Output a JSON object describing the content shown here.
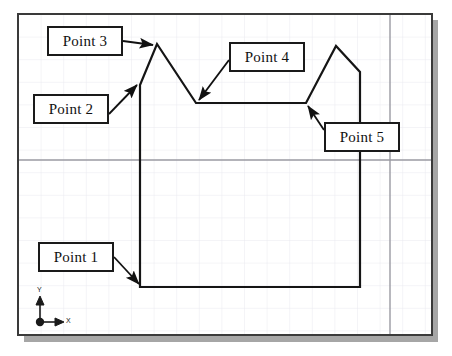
{
  "drawing": {
    "title": "CAD polyline sketch with point callouts",
    "background_color": "#ffffff",
    "frame": {
      "border_color": "#3a3a3a",
      "shadow_color": "#a6a6a6",
      "x": 18,
      "y": 14,
      "width": 414,
      "height": 321
    },
    "grid": {
      "minor_color": "#e9e9ef",
      "major_color": "#9a9aa2",
      "spacing": 22.6,
      "visible": true
    },
    "geometry_color": "#151515",
    "geometry_width": 2,
    "polyline": {
      "name": "profile-polyline",
      "vertices": [
        {
          "id": "p1",
          "x": 140,
          "y": 287,
          "label": "Point 1"
        },
        {
          "id": "p2",
          "x": 140,
          "y": 85,
          "label": "Point 2"
        },
        {
          "id": "p3",
          "x": 157,
          "y": 44,
          "label": "Point 3"
        },
        {
          "id": "p4",
          "x": 196,
          "y": 103,
          "label": "Point 4"
        },
        {
          "id": "p5",
          "x": 306,
          "y": 103,
          "label": "Point 5"
        },
        {
          "id": "p6",
          "x": 336,
          "y": 46,
          "label": ""
        },
        {
          "id": "p7",
          "x": 360,
          "y": 72,
          "label": ""
        },
        {
          "id": "p8",
          "x": 360,
          "y": 287,
          "label": ""
        }
      ],
      "closing_segment": {
        "from": "p8",
        "to": "p1"
      }
    },
    "callouts": [
      {
        "id": "callout-point-3",
        "label": "Point 3",
        "box": {
          "x": 47,
          "y": 26,
          "width": 76,
          "height": 30
        },
        "leader": {
          "x1": 123,
          "y1": 41,
          "x2": 153,
          "y2": 45
        }
      },
      {
        "id": "callout-point-2",
        "label": "Point 2",
        "box": {
          "x": 33,
          "y": 94,
          "width": 76,
          "height": 30
        },
        "leader": {
          "x1": 109,
          "y1": 114,
          "x2": 137,
          "y2": 85
        }
      },
      {
        "id": "callout-point-4",
        "label": "Point 4",
        "box": {
          "x": 229,
          "y": 42,
          "width": 76,
          "height": 30
        },
        "leader": {
          "x1": 229,
          "y1": 60,
          "x2": 199,
          "y2": 100
        }
      },
      {
        "id": "callout-point-5",
        "label": "Point 5",
        "box": {
          "x": 324,
          "y": 122,
          "width": 76,
          "height": 30
        },
        "leader": {
          "x1": 324,
          "y1": 130,
          "x2": 308,
          "y2": 106
        }
      },
      {
        "id": "callout-point-1",
        "label": "Point 1",
        "box": {
          "x": 38,
          "y": 242,
          "width": 76,
          "height": 30
        },
        "leader": {
          "x1": 114,
          "y1": 257,
          "x2": 139,
          "y2": 284
        }
      }
    ],
    "ucs_icon": {
      "name": "ucs-axis-icon",
      "origin": {
        "x": 40,
        "y": 322
      },
      "x_axis_label": "X",
      "y_axis_label": "Y",
      "color": "#1a1a1a"
    }
  }
}
